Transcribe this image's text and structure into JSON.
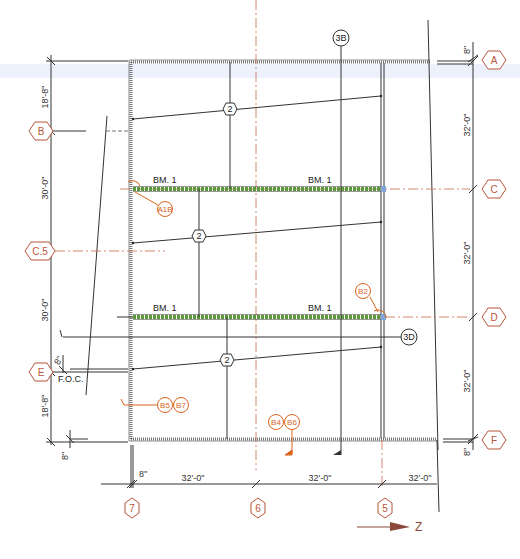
{
  "drawing": {
    "type": "structural framing plan",
    "north_arrow": {
      "label": "Z"
    },
    "colors": {
      "grid_bubble": "#b8553a",
      "tag": "#d9641e",
      "beam": "#5a9a3a",
      "line": "#333333",
      "highlight_band": "#dfe8f8"
    },
    "grid_rows": [
      {
        "id": "A",
        "label": "A"
      },
      {
        "id": "B",
        "label": "B"
      },
      {
        "id": "C",
        "label": "C"
      },
      {
        "id": "C5",
        "label": "C.5"
      },
      {
        "id": "D",
        "label": "D"
      },
      {
        "id": "E",
        "label": "E"
      },
      {
        "id": "F",
        "label": "F"
      }
    ],
    "grid_columns": [
      {
        "id": "7",
        "label": "7"
      },
      {
        "id": "6",
        "label": "6"
      },
      {
        "id": "5",
        "label": "5"
      }
    ],
    "left_dimensions": [
      {
        "label": "18'-8\""
      },
      {
        "label": "30'-0\""
      },
      {
        "label": "30'-0\""
      },
      {
        "label": "8\""
      },
      {
        "label": "18'-8\""
      },
      {
        "label": "8\""
      }
    ],
    "right_dimensions": [
      {
        "label": "8\""
      },
      {
        "label": "32'-0\""
      },
      {
        "label": "32'-0\""
      },
      {
        "label": "32'-0\""
      },
      {
        "label": "8\""
      }
    ],
    "bottom_dimensions": [
      {
        "label": "8\""
      },
      {
        "label": "32'-0\""
      },
      {
        "label": "32'-0\""
      },
      {
        "label": "32'-0\""
      }
    ],
    "foc_label": "F.O.C.",
    "beam_labels": [
      {
        "label": "BM. 1"
      },
      {
        "label": "BM. 1"
      },
      {
        "label": "BM. 1"
      },
      {
        "label": "BM. 1"
      }
    ],
    "joist_tags": [
      {
        "label": "2"
      },
      {
        "label": "2"
      },
      {
        "label": "2"
      }
    ],
    "section_tags": [
      {
        "label": "3B"
      },
      {
        "label": "3D"
      }
    ],
    "detail_tags": [
      {
        "label": "A1B"
      },
      {
        "label": "B2"
      },
      {
        "label": "B5"
      },
      {
        "label": "B7"
      },
      {
        "label": "B4"
      },
      {
        "label": "B6"
      }
    ]
  }
}
